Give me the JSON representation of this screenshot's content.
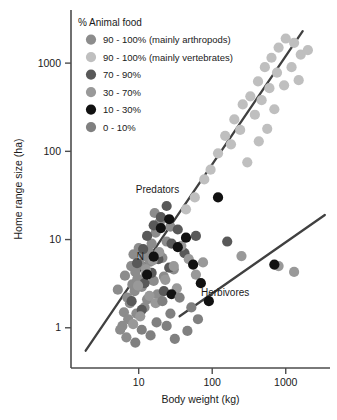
{
  "chart_data": {
    "type": "scatter",
    "title": "",
    "xlabel": "Body weight (kg)",
    "ylabel": "Home range size (ha)",
    "xscale": "log",
    "yscale": "log",
    "xlim": [
      1.2,
      4000
    ],
    "ylim": [
      0.35,
      4000
    ],
    "xticks": [
      10,
      100,
      1000
    ],
    "xticklabels": [
      "10",
      "100",
      "1000"
    ],
    "yticks": [
      1,
      10,
      100,
      1000
    ],
    "yticklabels": [
      "1",
      "10",
      "100",
      "1000"
    ],
    "grid": false,
    "legend_position": "top-left",
    "legend_title": "% Animal food",
    "series": [
      {
        "name": "90 - 100% (mainly arthropods)",
        "key": "arthropod",
        "color": "#8c8c8c",
        "points": [
          [
            7.0,
            2.2
          ],
          [
            7.6,
            1.9
          ],
          [
            8.2,
            3.1
          ],
          [
            6.3,
            1.5
          ],
          [
            9.0,
            4.3
          ],
          [
            10.5,
            5.2
          ],
          [
            11.8,
            6.5
          ],
          [
            9.6,
            3.6
          ],
          [
            12.5,
            4.0
          ],
          [
            8.8,
            2.6
          ],
          [
            7.2,
            1.25
          ],
          [
            6.0,
            1.05
          ],
          [
            13.5,
            7.5
          ],
          [
            15.0,
            9.0
          ],
          [
            11.0,
            2.9
          ],
          [
            14.2,
            5.6
          ],
          [
            17.0,
            12.0
          ],
          [
            19.5,
            16.0
          ],
          [
            16.0,
            3.4
          ],
          [
            21.0,
            6.2
          ],
          [
            5.6,
            0.95
          ],
          [
            6.8,
            0.78
          ],
          [
            9.3,
            1.45
          ],
          [
            12.0,
            1.7
          ],
          [
            24.0,
            9.5
          ],
          [
            27.0,
            14.0
          ],
          [
            10.0,
            8.0
          ],
          [
            8.5,
            6.8
          ],
          [
            13.0,
            2.1
          ],
          [
            18.0,
            2.4
          ],
          [
            22.0,
            3.8
          ],
          [
            30.0,
            4.6
          ],
          [
            6.5,
            3.9
          ],
          [
            5.2,
            2.7
          ],
          [
            7.9,
            5.0
          ],
          [
            16.5,
            20.0
          ]
        ]
      },
      {
        "name": "90 - 100% (mainly vertebrates)",
        "key": "vertebrate",
        "color": "#bfbfbf",
        "points": [
          [
            120,
            95
          ],
          [
            150,
            150
          ],
          [
            200,
            230
          ],
          [
            260,
            340
          ],
          [
            330,
            420
          ],
          [
            420,
            620
          ],
          [
            520,
            900
          ],
          [
            640,
            1150
          ],
          [
            800,
            1500
          ],
          [
            1000,
            1900
          ],
          [
            1300,
            1700
          ],
          [
            1600,
            1250
          ],
          [
            95,
            62
          ],
          [
            78,
            48
          ],
          [
            180,
            120
          ],
          [
            240,
            175
          ],
          [
            300,
            75
          ],
          [
            380,
            260
          ],
          [
            470,
            380
          ],
          [
            600,
            520
          ],
          [
            760,
            780
          ],
          [
            950,
            560
          ],
          [
            1200,
            900
          ],
          [
            700,
            300
          ],
          [
            560,
            180
          ],
          [
            430,
            130
          ],
          [
            58,
            30
          ],
          [
            44,
            22
          ],
          [
            2000,
            1400
          ],
          [
            1500,
            640
          ]
        ]
      },
      {
        "name": "70 - 90%",
        "key": "p70_90",
        "color": "#595959",
        "points": [
          [
            13.0,
            11.0
          ],
          [
            16.0,
            14.5
          ],
          [
            11.5,
            7.8
          ],
          [
            20.0,
            18.0
          ],
          [
            9.5,
            5.4
          ],
          [
            24.0,
            24.0
          ],
          [
            15.0,
            4.2
          ],
          [
            18.5,
            6.0
          ],
          [
            12.0,
            3.2
          ],
          [
            28.0,
            9.0
          ],
          [
            34.0,
            13.0
          ],
          [
            8.0,
            2.0
          ],
          [
            22.0,
            2.6
          ],
          [
            42.0,
            7.0
          ],
          [
            60.0,
            11.0
          ],
          [
            26.0,
            4.8
          ],
          [
            160,
            9.5
          ],
          [
            11.0,
            1.6
          ]
        ]
      },
      {
        "name": "30 - 70%",
        "key": "p30_70",
        "color": "#999999",
        "points": [
          [
            12.5,
            4.6
          ],
          [
            15.5,
            5.8
          ],
          [
            19.0,
            7.2
          ],
          [
            9.8,
            3.0
          ],
          [
            23.0,
            3.5
          ],
          [
            30.0,
            5.0
          ],
          [
            38.0,
            8.5
          ],
          [
            48.0,
            6.0
          ],
          [
            14.0,
            2.3
          ],
          [
            17.0,
            1.9
          ],
          [
            60.0,
            4.0
          ],
          [
            75.0,
            5.5
          ],
          [
            250,
            6.5
          ],
          [
            800,
            5.0
          ],
          [
            1300,
            4.3
          ],
          [
            10.5,
            1.35
          ],
          [
            8.4,
            1.1
          ],
          [
            33.0,
            2.8
          ]
        ]
      },
      {
        "name": "10 - 30%",
        "key": "p10_30",
        "color": "#111111",
        "points": [
          [
            20.0,
            13.5
          ],
          [
            26.0,
            17.0
          ],
          [
            120,
            30.0
          ],
          [
            34.0,
            8.2
          ],
          [
            44.0,
            10.5
          ],
          [
            16.0,
            6.4
          ],
          [
            55.0,
            5.2
          ],
          [
            700,
            5.2
          ],
          [
            70.0,
            3.2
          ],
          [
            13.0,
            4.0
          ],
          [
            28.0,
            2.4
          ],
          [
            90.0,
            2.0
          ]
        ]
      },
      {
        "name": "0 - 10%",
        "key": "p0_10",
        "color": "#808080",
        "points": [
          [
            21.0,
            2.0
          ],
          [
            36.0,
            2.2
          ],
          [
            52.0,
            1.7
          ],
          [
            17.5,
            1.15
          ],
          [
            27.0,
            1.45
          ],
          [
            11.0,
            0.95
          ],
          [
            14.5,
            0.82
          ],
          [
            64.0,
            1.25
          ],
          [
            46.0,
            0.92
          ],
          [
            9.0,
            0.68
          ],
          [
            31.0,
            0.75
          ],
          [
            24.0,
            1.05
          ]
        ]
      }
    ],
    "fit_lines": [
      {
        "name": "Predators",
        "label": "Predators",
        "color": "#404040",
        "x_start": 1.9,
        "y_start": 0.55,
        "x_end": 1700,
        "y_end": 2300
      },
      {
        "name": "Herbivores",
        "label": "Herbivores",
        "color": "#404040",
        "x_start": 36,
        "y_start": 1.35,
        "x_end": 3400,
        "y_end": 19
      }
    ],
    "annotations": [
      {
        "text": "Predators",
        "x": 18,
        "y": 34
      },
      {
        "text": "Herbivores",
        "x": 150,
        "y": 2.3
      },
      {
        "text": "N",
        "x": 10.5,
        "y": 5.9
      }
    ]
  },
  "legend": {
    "title": "% Animal food",
    "items": [
      {
        "label": "90 - 100% (mainly arthropods)",
        "color": "#8c8c8c"
      },
      {
        "label": "90 - 100% (mainly vertebrates)",
        "color": "#bfbfbf"
      },
      {
        "label": "70 - 90%",
        "color": "#595959"
      },
      {
        "label": "30 - 70%",
        "color": "#999999"
      },
      {
        "label": "10 - 30%",
        "color": "#111111"
      },
      {
        "label": "0 - 10%",
        "color": "#808080"
      }
    ]
  }
}
